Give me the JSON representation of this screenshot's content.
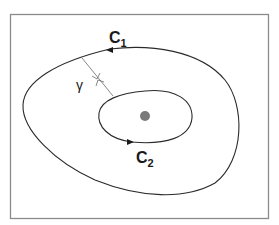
{
  "diagram": {
    "type": "contour-diagram",
    "colors": {
      "frame": "#8a8a8a",
      "curve": "#2a2a2a",
      "path": "#6a6a6a",
      "point": "#7a7a7a",
      "background": "#ffffff"
    },
    "curves": [
      {
        "id": "C1",
        "label_main": "C",
        "label_sub": "1",
        "kind": "outer-closed-curve",
        "orientation": "counterclockwise"
      },
      {
        "id": "C2",
        "label_main": "C",
        "label_sub": "2",
        "kind": "inner-closed-curve",
        "orientation": "counterclockwise"
      }
    ],
    "path": {
      "id": "gamma",
      "label": "γ",
      "kind": "crossing-cut"
    },
    "point": {
      "kind": "singular-point"
    }
  }
}
